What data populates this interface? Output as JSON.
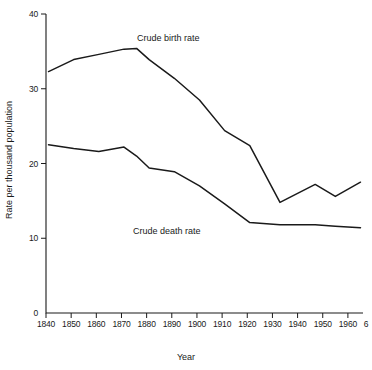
{
  "chart_data": {
    "type": "line",
    "title": "",
    "xlabel": "Year",
    "ylabel": "Rate per thousand population",
    "xlim": [
      1840,
      1966
    ],
    "ylim": [
      0,
      40
    ],
    "grid": false,
    "legend_position": "inline-annotations",
    "xticks": [
      1840,
      1850,
      1860,
      1870,
      1880,
      1890,
      1900,
      1910,
      1920,
      1930,
      1940,
      1950,
      1960
    ],
    "xtick_labels": [
      "1840",
      "1850",
      "1860",
      "1870",
      "1880",
      "1890",
      "1900",
      "1910",
      "1920",
      "1930",
      "1940",
      "1950",
      "1960"
    ],
    "xtick_end_label": "6",
    "yticks": [
      0,
      10,
      20,
      30,
      40
    ],
    "ytick_labels": [
      "0",
      "10",
      "20",
      "30",
      "40"
    ],
    "series": [
      {
        "name": "Crude birth rate",
        "annotation": "Crude birth rate",
        "x": [
          1841,
          1851,
          1861,
          1871,
          1876,
          1881,
          1891,
          1901,
          1911,
          1921,
          1933,
          1947,
          1955,
          1965
        ],
        "values": [
          32.3,
          33.9,
          34.6,
          35.3,
          35.4,
          33.9,
          31.4,
          28.5,
          24.4,
          22.4,
          14.8,
          17.2,
          15.6,
          17.5
        ]
      },
      {
        "name": "Crude death rate",
        "annotation": "Crude death rate",
        "x": [
          1841,
          1851,
          1861,
          1871,
          1876,
          1881,
          1891,
          1901,
          1911,
          1921,
          1933,
          1947,
          1955,
          1965
        ],
        "values": [
          22.5,
          22.0,
          21.6,
          22.2,
          21.0,
          19.4,
          18.9,
          17.0,
          14.6,
          12.1,
          11.8,
          11.8,
          11.6,
          11.4
        ]
      }
    ],
    "annotations": [
      {
        "text": "Crude birth rate",
        "x_px": 137,
        "y_px": 33
      },
      {
        "text": "Crude death rate",
        "x_px": 133,
        "y_px": 226
      }
    ]
  }
}
